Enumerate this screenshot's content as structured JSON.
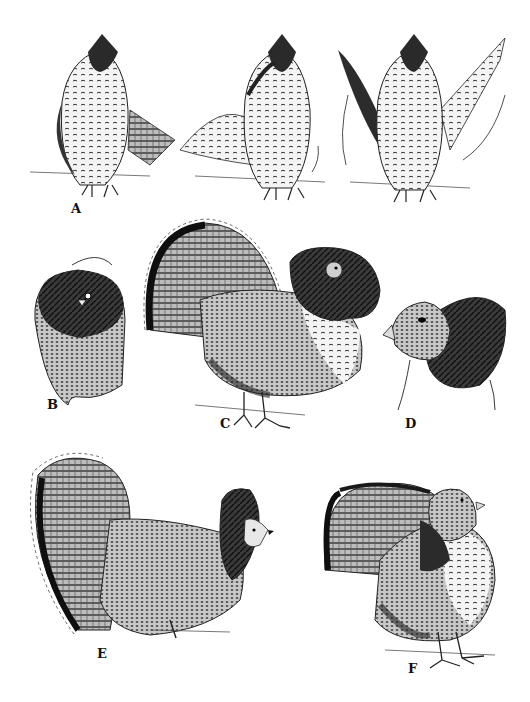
{
  "plate": {
    "background": "#ffffff",
    "ink": "#111111",
    "panels": [
      {
        "id": "A",
        "label": "A",
        "subject": "grouse standing upright, wing-beat sequence (three poses)"
      },
      {
        "id": "B",
        "label": "B",
        "subject": "grouse head with ruff, front view, head swaying (double arrow)"
      },
      {
        "id": "C",
        "label": "C",
        "subject": "displaying male, full fanned tail and raised ruff, front-side view"
      },
      {
        "id": "D",
        "label": "D",
        "subject": "close-up of head with erected ruff"
      },
      {
        "id": "E",
        "label": "E",
        "subject": "displaying male, side view, fanned tail and raised crest"
      },
      {
        "id": "F",
        "label": "F",
        "subject": "grouse with tail partially fanned, walking stance"
      }
    ]
  }
}
